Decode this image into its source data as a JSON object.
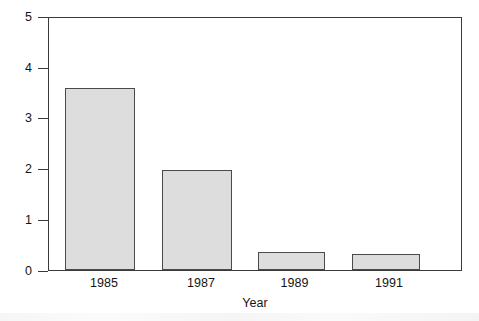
{
  "chart_data": {
    "type": "bar",
    "title": "",
    "xlabel": "Year",
    "ylabel": "Solution waste, Mg",
    "categories": [
      "1985",
      "1987",
      "1989",
      "1991"
    ],
    "values": [
      3.62,
      1.99,
      0.35,
      0.31
    ],
    "ylim": [
      0,
      5
    ],
    "yticks": [
      0,
      1,
      2,
      3,
      4,
      5
    ],
    "ytick_labels": [
      "0",
      "1",
      "2",
      "3",
      "4",
      "5"
    ],
    "xlim_categories": 4,
    "grid": false,
    "legend": null,
    "legend_position": "none",
    "bar_fill_color": "#dddddd",
    "bar_edge_color": "#4a4a4a",
    "axis_color": "#3a3a3a",
    "background_color": "#ffffff"
  },
  "axes": {
    "y_title": "Solution waste, Mg",
    "x_title": "Year"
  },
  "y_ticks": [
    {
      "label": "5",
      "value": 5
    },
    {
      "label": "4",
      "value": 4
    },
    {
      "label": "3",
      "value": 3
    },
    {
      "label": "2",
      "value": 2
    },
    {
      "label": "1",
      "value": 1
    },
    {
      "label": "0",
      "value": 0
    }
  ],
  "bars": [
    {
      "category": "1985",
      "value": 3.62
    },
    {
      "category": "1987",
      "value": 1.99
    },
    {
      "category": "1989",
      "value": 0.35
    },
    {
      "category": "1991",
      "value": 0.31
    }
  ]
}
